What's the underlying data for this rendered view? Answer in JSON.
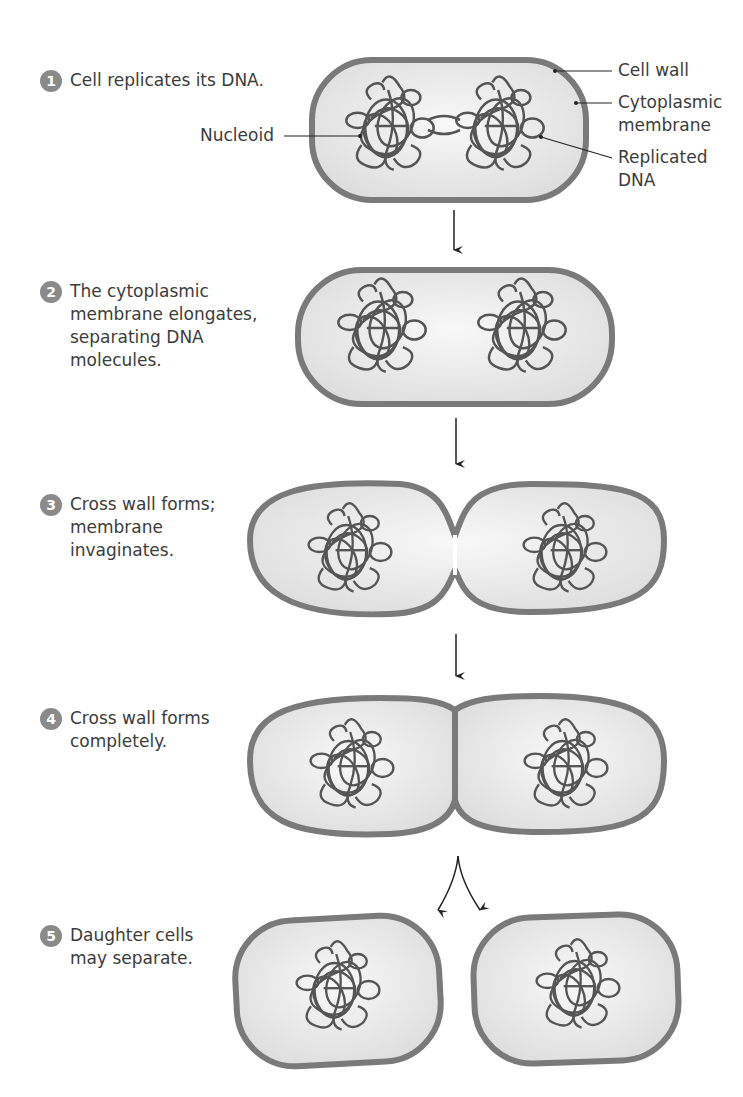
{
  "steps": [
    {
      "number": "1",
      "text": "Cell replicates its DNA."
    },
    {
      "number": "2",
      "text": "The cytoplasmic\nmembrane elongates,\nseparating DNA\nmolecules."
    },
    {
      "number": "3",
      "text": "Cross wall forms;\nmembrane\ninvaginates."
    },
    {
      "number": "4",
      "text": "Cross wall forms\ncompletely."
    },
    {
      "number": "5",
      "text": "Daughter cells\nmay separate."
    }
  ],
  "labels": {
    "nucleoid": "Nucleoid",
    "cell_wall": "Cell wall",
    "cytoplasmic_membrane": "Cytoplasmic\nmembrane",
    "replicated_dna": "Replicated\nDNA"
  },
  "colors": {
    "cell_wall": "#7a7a7a",
    "cytoplasm": "#ececec",
    "dna": "#555555",
    "badge": "#8a8a8a",
    "arrow": "#222222"
  }
}
